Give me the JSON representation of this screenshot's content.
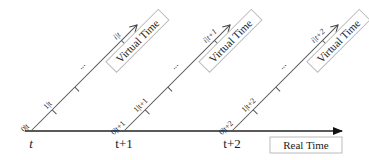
{
  "diagram": {
    "real_axis": {
      "label": "Real Time",
      "ticks": [
        "t",
        "t+1",
        "t+2"
      ]
    },
    "virtual_axes": [
      {
        "label": "Virtual Time",
        "origin_tick": "t",
        "ticks": [
          "0|t",
          "1|t",
          "...",
          "i|t"
        ]
      },
      {
        "label": "Virtual Time",
        "origin_tick": "t+1",
        "ticks": [
          "0|t+1",
          "1|t+1",
          "...",
          "i|t+1"
        ]
      },
      {
        "label": "Virtual Time",
        "origin_tick": "t+2",
        "ticks": [
          "0|t+2",
          "1|t+2",
          "...",
          "i|t+2"
        ]
      }
    ],
    "colors": {
      "line": "#333333",
      "box_border": "#bbbbbb",
      "text": "#222222"
    }
  }
}
